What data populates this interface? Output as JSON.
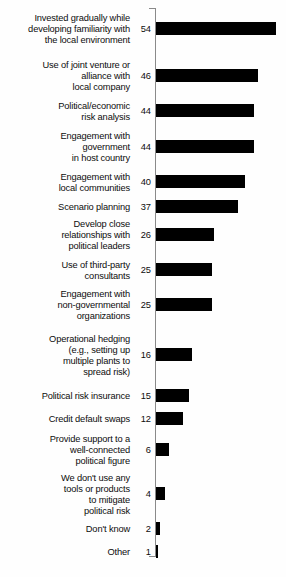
{
  "chart_data": {
    "type": "bar",
    "orientation": "horizontal",
    "title": "",
    "subtitle": "",
    "xlabel": "",
    "ylabel": "",
    "xlim": [
      0,
      54
    ],
    "grid": false,
    "legend": null,
    "bar_color": "#000000",
    "axis_color": "#8a8a8a",
    "value_labels_shown": true,
    "categories": [
      "Invested gradually while\ndeveloping familiarity with\nthe local environment",
      "Use of joint venture or\nalliance with\nlocal company",
      "Political/economic\nrisk analysis",
      "Engagement with\ngovernment\nin host country",
      "Engagement with\nlocal communities",
      "Scenario planning",
      "Develop close\nrelationships with\npolitical leaders",
      "Use of third-party\nconsultants",
      "Engagement with\nnon-governmental\norganizations",
      "Operational hedging\n(e.g., setting up\nmultiple plants to\nspread risk)",
      "Political risk insurance",
      "Credit default swaps",
      "Provide support to a\nwell-connected\npolitical figure",
      "We don't use any\ntools or products\nto mitigate\npolitical risk",
      "Don't know",
      "Other"
    ],
    "values": [
      54,
      46,
      44,
      44,
      40,
      37,
      26,
      25,
      25,
      16,
      15,
      12,
      6,
      4,
      2,
      1
    ]
  },
  "layout": {
    "rows": [
      {
        "label": "Invested gradually while\ndeveloping familiarity with\nthe local environment",
        "value": "54",
        "num": 54,
        "label_top": 13,
        "value_top": 24,
        "bar_top": 22
      },
      {
        "label": "Use of joint venture or\nalliance with\nlocal company",
        "value": "46",
        "num": 46,
        "label_top": 60,
        "value_top": 71,
        "bar_top": 69
      },
      {
        "label": "Political/economic\nrisk analysis",
        "value": "44",
        "num": 44,
        "label_top": 101,
        "value_top": 106,
        "bar_top": 104
      },
      {
        "label": "Engagement with\ngovernment\nin host country",
        "value": "44",
        "num": 44,
        "label_top": 131,
        "value_top": 142,
        "bar_top": 140
      },
      {
        "label": "Engagement with\nlocal communities",
        "value": "40",
        "num": 40,
        "label_top": 172,
        "value_top": 177,
        "bar_top": 175
      },
      {
        "label": "Scenario planning",
        "value": "37",
        "num": 37,
        "label_top": 202,
        "value_top": 202,
        "bar_top": 200
      },
      {
        "label": "Develop close\nrelationships with\npolitical leaders",
        "value": "26",
        "num": 26,
        "label_top": 219,
        "value_top": 230,
        "bar_top": 228
      },
      {
        "label": "Use of third-party\nconsultants",
        "value": "25",
        "num": 25,
        "label_top": 260,
        "value_top": 265,
        "bar_top": 263
      },
      {
        "label": "Engagement with\nnon-governmental\norganizations",
        "value": "25",
        "num": 25,
        "label_top": 289,
        "value_top": 300,
        "bar_top": 298
      },
      {
        "label": "Operational hedging\n(e.g., setting up\nmultiple plants to\nspread risk)",
        "value": "16",
        "num": 16,
        "label_top": 334,
        "value_top": 350,
        "bar_top": 348
      },
      {
        "label": "Political risk insurance",
        "value": "15",
        "num": 15,
        "label_top": 391,
        "value_top": 391,
        "bar_top": 389
      },
      {
        "label": "Credit default swaps",
        "value": "12",
        "num": 12,
        "label_top": 414,
        "value_top": 414,
        "bar_top": 412
      },
      {
        "label": "Provide support to a\nwell-connected\npolitical figure",
        "value": "6",
        "num": 6,
        "label_top": 434,
        "value_top": 445,
        "bar_top": 443
      },
      {
        "label": "We don't use any\ntools or products\nto mitigate\npolitical risk",
        "value": "4",
        "num": 4,
        "label_top": 473,
        "value_top": 489,
        "bar_top": 487
      },
      {
        "label": "Don't know",
        "value": "2",
        "num": 2,
        "label_top": 524,
        "value_top": 524,
        "bar_top": 522
      },
      {
        "label": "Other",
        "value": "1",
        "num": 1,
        "label_top": 547,
        "value_top": 547,
        "bar_top": 545
      }
    ],
    "px_per_unit": 2.22,
    "bar_origin_x": 156
  }
}
